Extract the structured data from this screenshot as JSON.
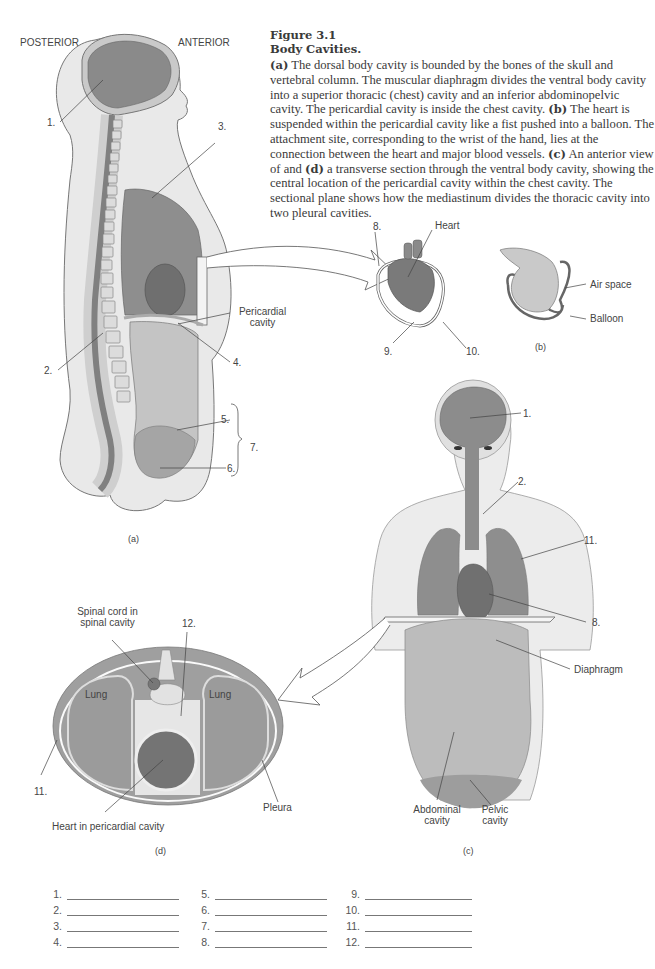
{
  "caption": {
    "figure_number": "Figure 3.1",
    "title": "Body Cavities.",
    "segments": [
      {
        "bold": "(a)",
        "text": " The dorsal body cavity is bounded by the bones of the skull and vertebral column. The muscular diaphragm divides the ventral body cavity into a superior thoracic (chest) cavity and an inferior abdominopelvic cavity. The pericardial cavity is inside the chest cavity. "
      },
      {
        "bold": "(b)",
        "text": " The heart is suspended within the pericardial cavity like a fist pushed into a balloon. The attachment site, corresponding to the wrist of the hand, lies at the connection between the heart and major blood vessels. "
      },
      {
        "bold": "(c)",
        "text": " An anterior view of and "
      },
      {
        "bold": "(d)",
        "text": " a transverse section through the ventral body cavity, showing the central location of the pericardial cavity within the chest cavity. The sectional plane shows how the mediastinum divides the thoracic cavity into two pleural cavities."
      }
    ]
  },
  "panel_a": {
    "orientation_left": "POSTERIOR",
    "orientation_right": "ANTERIOR",
    "labels": {
      "n1": "1.",
      "n2": "2.",
      "n3": "3.",
      "n4": "4.",
      "n5": "5.",
      "n6": "6.",
      "n7": "7.",
      "pericardial": "Pericardial",
      "pericardial2": "cavity"
    },
    "panel_label": "(a)"
  },
  "panel_heart": {
    "labels": {
      "n8": "8.",
      "heart": "Heart",
      "n9": "9.",
      "n10": "10."
    }
  },
  "panel_b": {
    "labels": {
      "air_space": "Air space",
      "balloon": "Balloon"
    },
    "panel_label": "(b)"
  },
  "panel_c": {
    "labels": {
      "n1": "1.",
      "n2": "2.",
      "n11": "11.",
      "n8": "8.",
      "diaphragm": "Diaphragm",
      "abdominal": "Abdominal",
      "abdominal2": "cavity",
      "pelvic": "Pelvic",
      "pelvic2": "cavity"
    },
    "panel_label": "(c)"
  },
  "panel_d": {
    "labels": {
      "spinal": "Spinal cord in",
      "spinal2": "spinal cavity",
      "n12": "12.",
      "lung_left": "Lung",
      "lung_right": "Lung",
      "n11": "11.",
      "pleura": "Pleura",
      "heart": "Heart in pericardial cavity"
    },
    "panel_label": "(d)"
  },
  "answers": {
    "columns": [
      [
        "1.",
        "2.",
        "3.",
        "4."
      ],
      [
        "5.",
        "6.",
        "7.",
        "8."
      ],
      [
        "9.",
        "10.",
        "11.",
        "12."
      ]
    ]
  },
  "colors": {
    "cavity_dark": "#7d7d7d",
    "cavity_mid": "#9a9a9a",
    "cavity_light": "#bdbdbd",
    "skin": "#e6e6e6",
    "outline": "#6a6a6a"
  }
}
